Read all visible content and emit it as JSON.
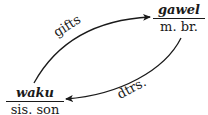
{
  "nodes": {
    "top_right": {
      "term": "gawel",
      "gloss": "m. br."
    },
    "bottom_left": {
      "term": "waku",
      "gloss": "sis. son"
    }
  },
  "edges": {
    "upper": {
      "label": "gifts",
      "from": "waku",
      "to": "gawel"
    },
    "lower": {
      "label": "dtrs.",
      "from": "gawel",
      "to": "waku"
    }
  }
}
